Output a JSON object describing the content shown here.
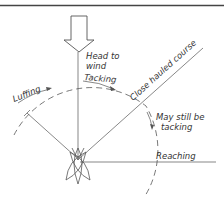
{
  "diagram": {
    "labels": {
      "head_to_wind_1": "Head to",
      "head_to_wind_2": "wind",
      "tacking": "Tacking",
      "luffing": "Luffing",
      "close_hauled": "Close hauled course",
      "may_still_1": "May still be",
      "may_still_2": "tacking",
      "reaching": "Reaching"
    },
    "icons": {
      "wind_arrow": "wind-arrow-icon",
      "boat": "boat-positions-icon"
    },
    "colors": {
      "line": "#555555",
      "text": "#333333",
      "background": "#ffffff"
    }
  }
}
